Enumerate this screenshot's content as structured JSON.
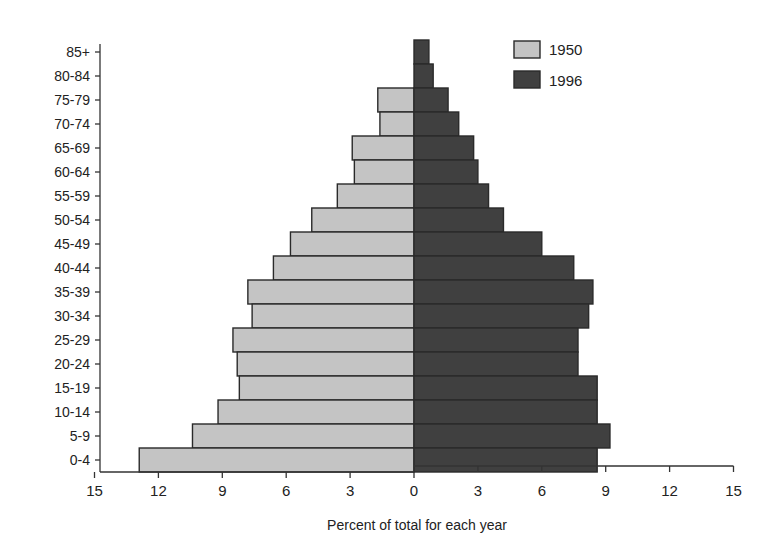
{
  "chart_data": {
    "type": "bar",
    "orientation": "horizontal",
    "subtype": "population-pyramid",
    "title": "",
    "xlabel": "Percent of total for each year",
    "ylabel": "",
    "xlim": [
      -15,
      15
    ],
    "x_ticks": [
      15,
      12,
      9,
      6,
      3,
      0,
      3,
      6,
      9,
      12,
      15
    ],
    "grid": false,
    "legend_position": "top-right",
    "categories": [
      "85+",
      "80-84",
      "75-79",
      "70-74",
      "65-69",
      "60-64",
      "55-59",
      "50-54",
      "45-49",
      "40-44",
      "35-39",
      "30-34",
      "25-29",
      "20-24",
      "15-19",
      "10-14",
      "5-9",
      "0-4"
    ],
    "series": [
      {
        "name": "1950",
        "side": "left",
        "color": "#c4c4c4",
        "values": [
          0,
          0,
          1.7,
          1.6,
          2.9,
          2.8,
          3.6,
          4.8,
          5.8,
          6.6,
          7.8,
          7.6,
          8.5,
          8.3,
          8.2,
          9.2,
          10.4,
          12.9
        ]
      },
      {
        "name": "1996",
        "side": "right",
        "color": "#404040",
        "values": [
          0.7,
          0.9,
          1.6,
          2.1,
          2.8,
          3.0,
          3.5,
          4.2,
          6.0,
          7.5,
          8.4,
          8.2,
          7.7,
          7.7,
          8.6,
          8.6,
          9.2,
          8.6
        ]
      }
    ]
  }
}
